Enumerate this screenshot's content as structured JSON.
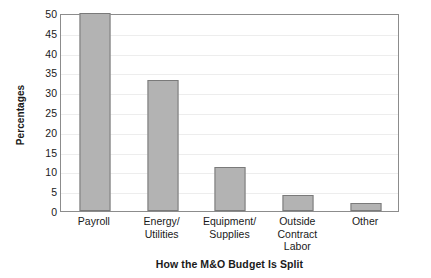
{
  "chart_data": {
    "type": "bar",
    "title": "",
    "xlabel": "How the M&O Budget Is Split",
    "ylabel": "Percentages",
    "categories": [
      "Payroll",
      "Energy/ Utilities",
      "Equipment/ Supplies",
      "Outside Contract Labor",
      "Other"
    ],
    "category_lines": [
      [
        "Payroll"
      ],
      [
        "Energy/",
        "Utilities"
      ],
      [
        "Equipment/",
        "Supplies"
      ],
      [
        "Outside",
        "Contract",
        "Labor"
      ],
      [
        "Other"
      ]
    ],
    "values": [
      50,
      33,
      11,
      4,
      2
    ],
    "ylim": [
      0,
      50
    ],
    "yticks": [
      0,
      5,
      10,
      15,
      20,
      25,
      30,
      35,
      40,
      45,
      50
    ],
    "ytick_labels": [
      "0",
      "5",
      "10",
      "15",
      "20",
      "25",
      "30",
      "35",
      "40",
      "45",
      "50"
    ],
    "grid": true,
    "legend": false,
    "bar_color": "#b3b3b3",
    "bar_edge_color": "#7a7a7a",
    "axis_color": "#8c8c8c",
    "gridline_color": "#ededed",
    "background_color": "#ffffff"
  }
}
